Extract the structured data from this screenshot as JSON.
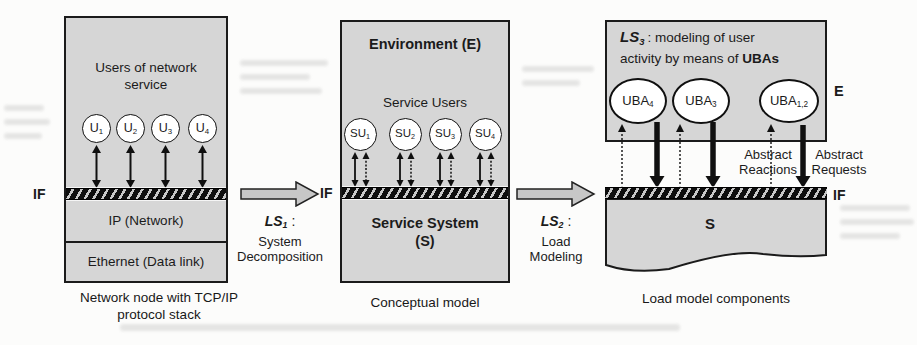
{
  "colors": {
    "background": "#fcfcfb",
    "panel_fill": "#d6d6d6",
    "box_border": "#1b1b1b",
    "block_arrow_fill": "#c7c7c7",
    "hatch_dark": "#0e0e0e",
    "hatch_light": "#c8c8c8",
    "node_fill": "#ffffff"
  },
  "panels": {
    "node": {
      "if_label": "IF",
      "title_line1": "Users of network",
      "title_line2": "service",
      "users": [
        {
          "base": "U",
          "sub": "1"
        },
        {
          "base": "U",
          "sub": "2"
        },
        {
          "base": "U",
          "sub": "3"
        },
        {
          "base": "U",
          "sub": "4"
        }
      ],
      "ip_layer": "IP (Network)",
      "eth_layer": "Ethernet (Data link)",
      "caption_line1": "Network node with TCP/IP",
      "caption_line2": "protocol stack"
    },
    "conceptual": {
      "header": "Environment (E)",
      "users_label": "Service Users",
      "users": [
        {
          "base": "SU",
          "sub": "1"
        },
        {
          "base": "SU",
          "sub": "2"
        },
        {
          "base": "SU",
          "sub": "3"
        },
        {
          "base": "SU",
          "sub": "4"
        }
      ],
      "if_label": "IF",
      "system_line1": "Service System",
      "system_line2": "(S)",
      "caption": "Conceptual model"
    },
    "load": {
      "ls_base": "LS",
      "ls_sub": "3",
      "ls_rest": ": modeling of user",
      "line2_plain": "activity by means of ",
      "line2_bold": "UBAs",
      "e_label": "E",
      "ubas": [
        {
          "base": "UBA",
          "sub": "4"
        },
        {
          "base": "UBA",
          "sub": "3"
        },
        {
          "base": "UBA",
          "sub": "1,2"
        }
      ],
      "reactions_line1": "Abstract",
      "reactions_line2": "Reactions",
      "requests_line1": "Abstract",
      "requests_line2": "Requests",
      "if_label": "IF",
      "s_label": "S",
      "caption": "Load model components"
    }
  },
  "transitions": {
    "ls1": {
      "base": "LS",
      "sub": "1",
      "suffix": " :",
      "desc_line1": "System",
      "desc_line2": "Decomposition"
    },
    "ls2": {
      "base": "LS",
      "sub": "2",
      "suffix": " :",
      "desc_line1": "Load",
      "desc_line2": "Modeling"
    }
  }
}
